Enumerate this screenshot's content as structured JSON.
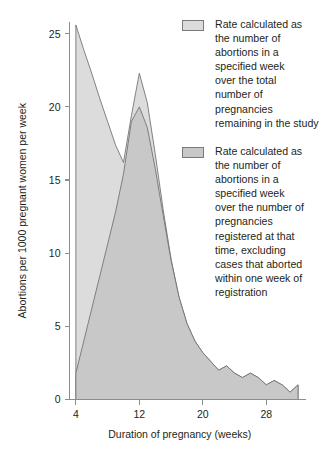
{
  "figure": {
    "background_color": "#ffffff"
  },
  "axes": {
    "y_title": "Abortions per 1000 pregnant women per week",
    "x_title": "Duration of pregnancy (weeks)",
    "y_ticks": [
      "0",
      "5",
      "10",
      "15",
      "20",
      "25"
    ],
    "x_ticks": [
      "4",
      "12",
      "20",
      "28"
    ]
  },
  "legend": {
    "entries": [
      {
        "swatch_color": "#dcdcdc",
        "swatch_border": "#7a7a7a",
        "label": "Rate calculated as\nthe number of\nabortions in a\nspecified week\nover the total\nnumber of\npregnancies\nremaining in the study"
      },
      {
        "swatch_color": "#c8c8c8",
        "swatch_border": "#7a7a7a",
        "label": "Rate calculated as\nthe number of\nabortions in a\nspecified week\nover the number of\npregnancies\nregistered at that\ntime, excluding\ncases that aborted\nwithin one week of\nregistration"
      }
    ]
  },
  "chart_data": {
    "type": "area",
    "title": "",
    "xlabel": "Duration of pregnancy (weeks)",
    "ylabel": "Abortions per 1000 pregnant women per week",
    "xlim": [
      3.2,
      32.5
    ],
    "ylim": [
      0,
      25.8
    ],
    "xticks": [
      4,
      12,
      20,
      28
    ],
    "yticks": [
      0,
      5,
      10,
      15,
      20,
      25
    ],
    "grid": false,
    "legend_position": "right",
    "colors": {
      "series_1_fill": "#dcdcdc",
      "series_2_fill": "#c8c8c8",
      "outline": "#6f6f6f",
      "axis": "#8d8d8d",
      "text": "#231f20"
    },
    "x": [
      4,
      5,
      6,
      7,
      8,
      9,
      10,
      11,
      12,
      13,
      14,
      15,
      16,
      17,
      18,
      19,
      20,
      21,
      22,
      23,
      24,
      25,
      26,
      27,
      28,
      29,
      30,
      31,
      32
    ],
    "series": [
      {
        "name": "Rate calculated as the number of abortions in a specified week over the total number of pregnancies remaining in the study",
        "fill": "#dcdcdc",
        "values": [
          25.6,
          23.9,
          22.3,
          20.6,
          19.0,
          17.4,
          16.2,
          19.4,
          22.3,
          20.3,
          16.8,
          13.0,
          9.6,
          7.0,
          5.2,
          4.0,
          3.2,
          2.6,
          2.0,
          2.3,
          1.8,
          1.5,
          1.8,
          1.5,
          1.0,
          1.3,
          1.0,
          0.5,
          1.0
        ]
      },
      {
        "name": "Rate calculated as the number of abortions in a specified week over the number of pregnancies registered at that time, excluding cases that aborted within one week of registration",
        "fill": "#c8c8c8",
        "values": [
          1.8,
          4.0,
          6.2,
          8.4,
          10.6,
          12.8,
          15.4,
          19.0,
          20.0,
          18.6,
          15.8,
          12.6,
          9.5,
          7.0,
          5.2,
          4.0,
          3.2,
          2.6,
          2.0,
          2.3,
          1.8,
          1.5,
          1.8,
          1.5,
          1.0,
          1.3,
          1.0,
          0.5,
          1.0
        ]
      }
    ]
  }
}
